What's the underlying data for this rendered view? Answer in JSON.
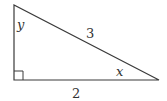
{
  "figure": {
    "type": "right-triangle",
    "stroke_color": "#3a3a3a",
    "label_color": "#333333",
    "vertices": [
      "top",
      "right-angle",
      "right"
    ],
    "right_angle_marker": true,
    "labels": {
      "angle_top": "y",
      "hypotenuse": "3",
      "angle_right": "x",
      "base": "2"
    }
  }
}
